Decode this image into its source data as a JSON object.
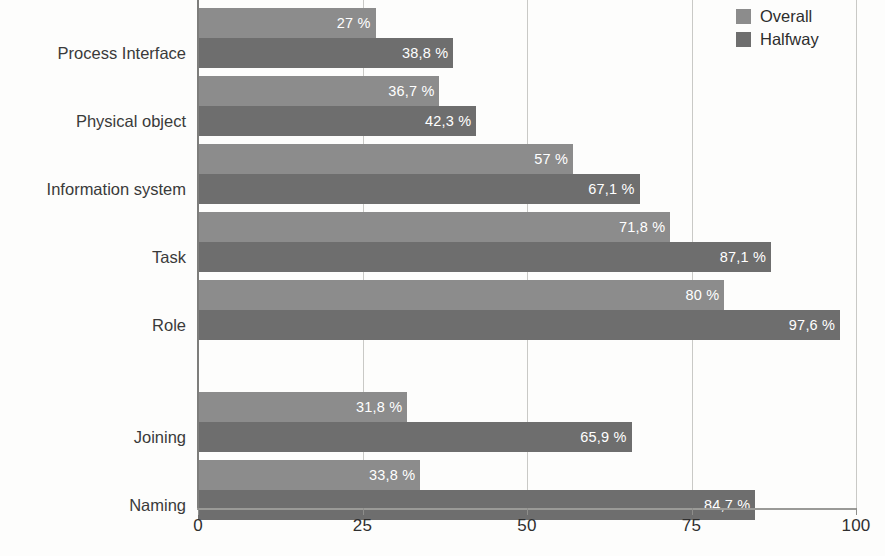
{
  "chart_data": {
    "type": "bar",
    "orientation": "horizontal",
    "title": "",
    "xlabel": "",
    "ylabel": "",
    "xlim": [
      0,
      100
    ],
    "xticks": [
      0,
      25,
      50,
      75,
      100
    ],
    "xticklabels": [
      "0",
      "25",
      "50",
      "75",
      "100"
    ],
    "grid": true,
    "grid_axis": "x",
    "legend": {
      "position": "top-right",
      "entries": [
        {
          "name": "Overall",
          "color": "#8c8c8c"
        },
        {
          "name": "Halfway",
          "color": "#6e6e6e"
        }
      ]
    },
    "categories": [
      "Process Interface",
      "Physical object",
      "Information system",
      "Task",
      "Role",
      "Joining",
      "Naming"
    ],
    "series": [
      {
        "name": "Overall",
        "color": "#8c8c8c",
        "values": [
          27,
          36.7,
          57,
          71.8,
          80,
          31.8,
          33.8
        ],
        "labels": [
          "27 %",
          "36,7 %",
          "57 %",
          "71,8 %",
          "80 %",
          "31,8 %",
          "33,8 %"
        ]
      },
      {
        "name": "Halfway",
        "color": "#6e6e6e",
        "values": [
          38.8,
          42.3,
          67.1,
          87.1,
          97.6,
          65.9,
          84.7
        ],
        "labels": [
          "38,8 %",
          "42,3 %",
          "67,1 %",
          "87,1 %",
          "97,6 %",
          "65,9 %",
          "84,7 %"
        ]
      }
    ],
    "group_break_after_category_index": 4,
    "value_label_suffix": "%",
    "decimal_separator": ","
  },
  "geometry": {
    "axis_x0_px": 198,
    "axis_x100_px": 856,
    "axis_baseline_px": 508,
    "bar_height_px": 30,
    "group_rows_y": [
      {
        "category": "Process Interface",
        "overall_top": 8,
        "halfway_top": 38,
        "center": 53
      },
      {
        "category": "Physical object",
        "overall_top": 76,
        "halfway_top": 106,
        "center": 121
      },
      {
        "category": "Information system",
        "overall_top": 144,
        "halfway_top": 174,
        "center": 189
      },
      {
        "category": "Task",
        "overall_top": 212,
        "halfway_top": 242,
        "center": 257
      },
      {
        "category": "Role",
        "overall_top": 280,
        "halfway_top": 310,
        "center": 325
      },
      {
        "category": "Joining",
        "overall_top": 392,
        "halfway_top": 422,
        "center": 437
      },
      {
        "category": "Naming",
        "overall_top": 460,
        "halfway_top": 490,
        "center": 505
      }
    ]
  },
  "colors": {
    "overall": "#8c8c8c",
    "halfway": "#6e6e6e",
    "gridline": "#c9c9c6",
    "axis": "#7d7d7b",
    "text": "#2f2f2f",
    "value_label_text": "#ffffff",
    "background": "#fdfdfc"
  }
}
